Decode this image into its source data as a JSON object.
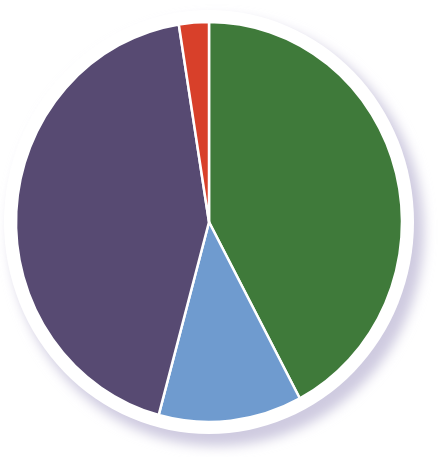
{
  "chart_data": {
    "type": "pie",
    "title": "",
    "categories": [
      "Green",
      "Blue",
      "Purple",
      "Red"
    ],
    "values": [
      42.2,
      12.0,
      43.3,
      2.5
    ],
    "colors": [
      "#3f7a3a",
      "#6f9bcf",
      "#574a72",
      "#d8402a"
    ],
    "start_angle_deg": 0,
    "direction": "clockwise",
    "labels_shown": false,
    "legend": "none"
  },
  "style": {
    "center": [
      209,
      222
    ],
    "rx": 193,
    "ry": 200,
    "ring_color": "#ffffff",
    "ring_width": 12,
    "shadow_color": "#cfcbe0"
  }
}
